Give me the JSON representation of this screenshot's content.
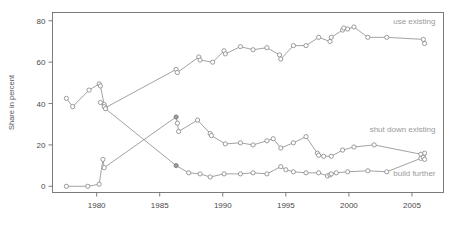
{
  "chart": {
    "title": "",
    "ylabel": "Share in percent",
    "xlabel": "",
    "y_ticks": [
      "0",
      "20",
      "40",
      "60",
      "80"
    ],
    "x_ticks": [
      "1980",
      "1985",
      "1990",
      "1995",
      "2000",
      "2005"
    ],
    "legend": {
      "use_existing": "use existing",
      "shut_down_existing": "shut down existing",
      "build_further": "build further"
    },
    "colors": {
      "line": "#8a8a8a",
      "marker_fill": "#ffffff",
      "marker_stroke": "#8a8a8a",
      "axis": "#6e6e6e",
      "label": "#4a4a4a",
      "series_label": "#9a9a9a",
      "background": "#ffffff"
    }
  },
  "chart_data": {
    "type": "line",
    "title": "",
    "xlabel": "",
    "ylabel": "Share in percent",
    "xlim": [
      1976.5,
      2007.5
    ],
    "ylim": [
      -3,
      84
    ],
    "grid": false,
    "legend_position": "inline-right",
    "x_ticks": [
      1980,
      1985,
      1990,
      1995,
      2000,
      2005
    ],
    "y_ticks": [
      0,
      20,
      40,
      60,
      80
    ],
    "series": [
      {
        "name": "use existing",
        "label_position": "top-right",
        "points": [
          [
            1977.6,
            42.5
          ],
          [
            1978.1,
            38.5
          ],
          [
            1979.4,
            46.5
          ],
          [
            1980.2,
            49.5
          ],
          [
            1980.3,
            48.5
          ],
          [
            1980.6,
            39.5
          ],
          [
            1980.7,
            38.0
          ],
          [
            1986.3,
            56.5
          ],
          [
            1986.4,
            55.0
          ],
          [
            1988.1,
            62.5
          ],
          [
            1988.2,
            61.0
          ],
          [
            1989.2,
            60.0
          ],
          [
            1990.1,
            65.5
          ],
          [
            1990.2,
            64.0
          ],
          [
            1991.4,
            67.5
          ],
          [
            1992.4,
            66.0
          ],
          [
            1993.5,
            67.0
          ],
          [
            1994.5,
            63.5
          ],
          [
            1994.6,
            61.5
          ],
          [
            1995.6,
            68.0
          ],
          [
            1996.6,
            68.0
          ],
          [
            1997.6,
            72.0
          ],
          [
            1998.5,
            70.0
          ],
          [
            1998.6,
            72.0
          ],
          [
            1999.5,
            75.5
          ],
          [
            1999.6,
            76.5
          ],
          [
            1999.9,
            76.0
          ],
          [
            2000.4,
            77.0
          ],
          [
            2001.5,
            72.0
          ],
          [
            2003.0,
            72.0
          ],
          [
            2005.9,
            71.0
          ],
          [
            2006.0,
            69.0
          ]
        ]
      },
      {
        "name": "shut down existing",
        "label_position": "bottom-right",
        "points": [
          [
            1980.3,
            40.5
          ],
          [
            1980.6,
            38.5
          ],
          [
            1980.7,
            37.5
          ],
          [
            1986.3,
            10.0
          ],
          [
            1987.3,
            6.5
          ],
          [
            1988.2,
            6.0
          ],
          [
            1989.0,
            4.5
          ],
          [
            1990.1,
            6.0
          ],
          [
            1991.4,
            6.0
          ],
          [
            1992.4,
            6.5
          ],
          [
            1993.5,
            6.0
          ],
          [
            1994.6,
            9.5
          ],
          [
            1995.0,
            8.0
          ],
          [
            1995.6,
            7.0
          ],
          [
            1996.6,
            6.5
          ],
          [
            1997.6,
            6.5
          ],
          [
            1998.3,
            5.0
          ],
          [
            1998.5,
            5.5
          ],
          [
            1998.6,
            6.0
          ],
          [
            1999.0,
            6.5
          ],
          [
            1999.9,
            7.0
          ],
          [
            2001.5,
            7.5
          ],
          [
            2003.0,
            7.0
          ],
          [
            2005.7,
            13.5
          ],
          [
            2005.9,
            15.0
          ],
          [
            2006.0,
            16.0
          ]
        ]
      },
      {
        "name": "build further",
        "label_position": "mid-right",
        "points": [
          [
            1977.6,
            0.0
          ],
          [
            1979.3,
            0.0
          ],
          [
            1980.2,
            1.0
          ],
          [
            1980.5,
            13.0
          ],
          [
            1980.6,
            9.0
          ],
          [
            1986.3,
            33.5
          ],
          [
            1986.4,
            30.5
          ],
          [
            1986.5,
            26.5
          ],
          [
            1988.0,
            32.0
          ],
          [
            1989.0,
            25.5
          ],
          [
            1989.1,
            24.5
          ],
          [
            1990.2,
            20.5
          ],
          [
            1991.4,
            21.0
          ],
          [
            1992.4,
            20.0
          ],
          [
            1993.5,
            22.0
          ],
          [
            1994.0,
            23.0
          ],
          [
            1994.6,
            18.5
          ],
          [
            1995.6,
            21.0
          ],
          [
            1996.6,
            24.0
          ],
          [
            1997.5,
            16.0
          ],
          [
            1997.6,
            15.0
          ],
          [
            1998.0,
            14.5
          ],
          [
            1998.6,
            14.5
          ],
          [
            1999.5,
            17.5
          ],
          [
            2000.4,
            19.0
          ],
          [
            2002.0,
            20.0
          ],
          [
            2005.7,
            15.5
          ],
          [
            2005.9,
            14.0
          ],
          [
            2006.0,
            13.0
          ]
        ]
      }
    ]
  }
}
